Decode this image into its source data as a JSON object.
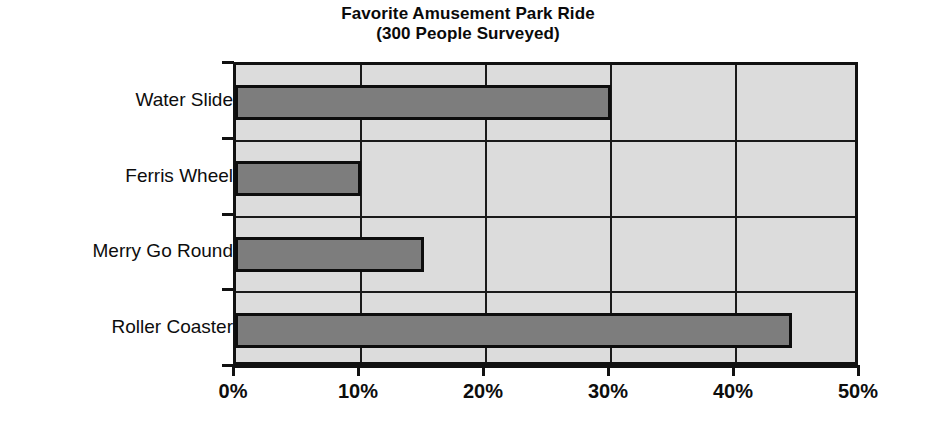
{
  "chart_data": {
    "type": "bar",
    "orientation": "horizontal",
    "title": "Favorite Amusement Park Ride",
    "subtitle": "(300 People Surveyed)",
    "categories": [
      "Water Slide",
      "Ferris Wheel",
      "Merry Go Round",
      "Roller Coaster"
    ],
    "values": [
      30,
      10,
      15,
      44.5
    ],
    "value_unit": "%",
    "xlabel": "",
    "ylabel": "",
    "xlim": [
      0,
      50
    ],
    "xticks": [
      0,
      10,
      20,
      30,
      40,
      50
    ],
    "xtick_labels": [
      "0%",
      "10%",
      "20%",
      "30%",
      "40%",
      "50%"
    ],
    "grid": true,
    "grid_axis": "both",
    "legend": false,
    "colors": {
      "bar_fill": "#7d7d7d",
      "bar_edge": "#0d0d0d",
      "plot_background": "#dcdcdc",
      "axis": "#111111",
      "text": "#0d0d0d",
      "figure_background": "#ffffff"
    }
  },
  "axis": {
    "y_tick_count": 5
  },
  "scan_artifact": {
    "line1": "two five men responded",
    "line2": "what the total image ten",
    "line3": "0.000 x 2   1/2  =  0.00"
  }
}
